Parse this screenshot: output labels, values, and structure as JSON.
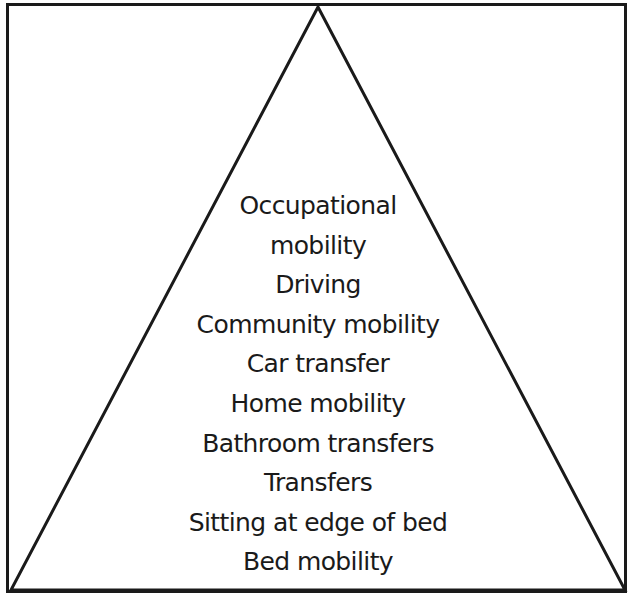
{
  "diagram": {
    "type": "pyramid",
    "colors": {
      "stroke": "#1a1a1a",
      "background": "#ffffff",
      "text": "#1a1a1a"
    },
    "levels_top_to_bottom": [
      "Occupational",
      "mobility",
      "Driving",
      "Community mobility",
      "Car transfer",
      "Home mobility",
      "Bathroom transfers",
      "Transfers",
      "Sitting at edge of bed",
      "Bed mobility"
    ]
  }
}
